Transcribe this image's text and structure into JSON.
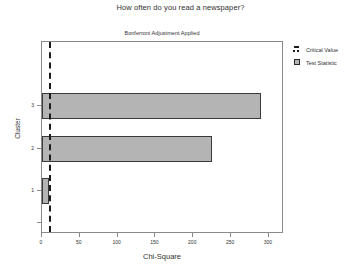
{
  "chart_data": {
    "type": "bar",
    "orientation": "horizontal",
    "title": "How often do you read a newspaper?",
    "subtitle": "Bonferroni Adjustment Applied",
    "xlabel": "Chi-Square",
    "ylabel": "Cluster",
    "categories": [
      "1",
      "2",
      "3"
    ],
    "series": [
      {
        "name": "Test Statistic",
        "values": [
          9,
          225,
          290
        ],
        "color": "#b4b4b4"
      }
    ],
    "reference_lines": [
      {
        "name": "Critical Value",
        "value": 9,
        "style": "dashed",
        "color": "#1a1a1a"
      }
    ],
    "xlim": [
      0,
      320
    ],
    "ylim_categories": [
      "1",
      "2",
      "3"
    ],
    "xticks": [
      0,
      50,
      100,
      150,
      200,
      250,
      300
    ],
    "xticklabels": [
      "0",
      "50",
      "100",
      "150",
      "200",
      "250",
      "300"
    ],
    "yticks": [
      "1",
      "2",
      "3"
    ],
    "yticklabels": [
      "1",
      "2",
      "3"
    ],
    "grid": false,
    "legend_position": "right",
    "legend": [
      {
        "label": "Critical Value",
        "marker": "dashed-line-swatch"
      },
      {
        "label": "Test Statistic",
        "marker": "filled-square-swatch"
      }
    ]
  }
}
